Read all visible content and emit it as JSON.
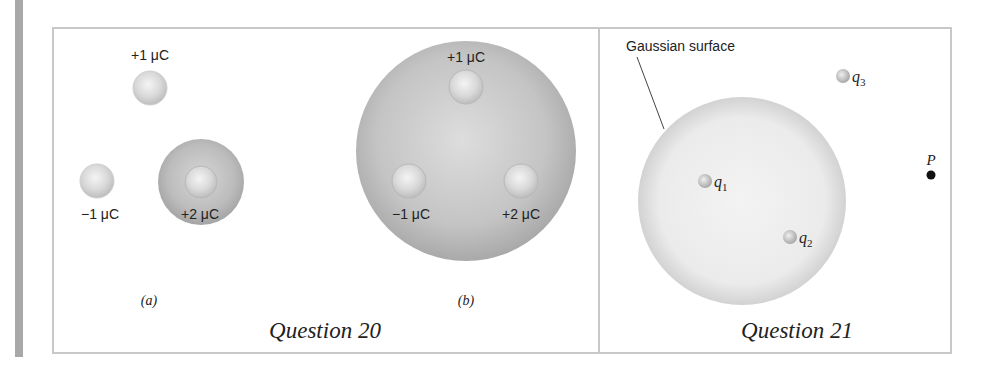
{
  "question20": {
    "title": "Question 20",
    "panel_a": {
      "label": "(a)",
      "charges": [
        {
          "label": "+1 μC",
          "cx": 150,
          "cy": 88
        },
        {
          "label": "−1 μC",
          "cx": 97,
          "cy": 181
        },
        {
          "label": "+2 μC",
          "cx": 201,
          "cy": 182,
          "enclosing_sphere": true
        }
      ]
    },
    "panel_b": {
      "label": "(b)",
      "charges": [
        {
          "label": "+1 μC",
          "cx": 466,
          "cy": 87
        },
        {
          "label": "−1 μC",
          "cx": 409,
          "cy": 181
        },
        {
          "label": "+2 μC",
          "cx": 521,
          "cy": 181
        }
      ],
      "enclosing_sphere": {
        "cx": 466,
        "cy": 151,
        "r": 110
      }
    }
  },
  "question21": {
    "title": "Question 21",
    "surface_label": "Gaussian surface",
    "charges": [
      {
        "name": "q",
        "sub": "1",
        "cx": 705,
        "cy": 181
      },
      {
        "name": "q",
        "sub": "2",
        "cx": 790,
        "cy": 237
      },
      {
        "name": "q",
        "sub": "3",
        "cx": 843,
        "cy": 76
      }
    ],
    "point": {
      "label": "P",
      "cx": 931,
      "cy": 175
    }
  },
  "colors": {
    "frame": "#c8c8c8",
    "sidebar_bar": "#a8a8a8",
    "sphere_gray": "#b9b9b9",
    "gaussian_fill": "#ececec",
    "text": "#222222"
  }
}
